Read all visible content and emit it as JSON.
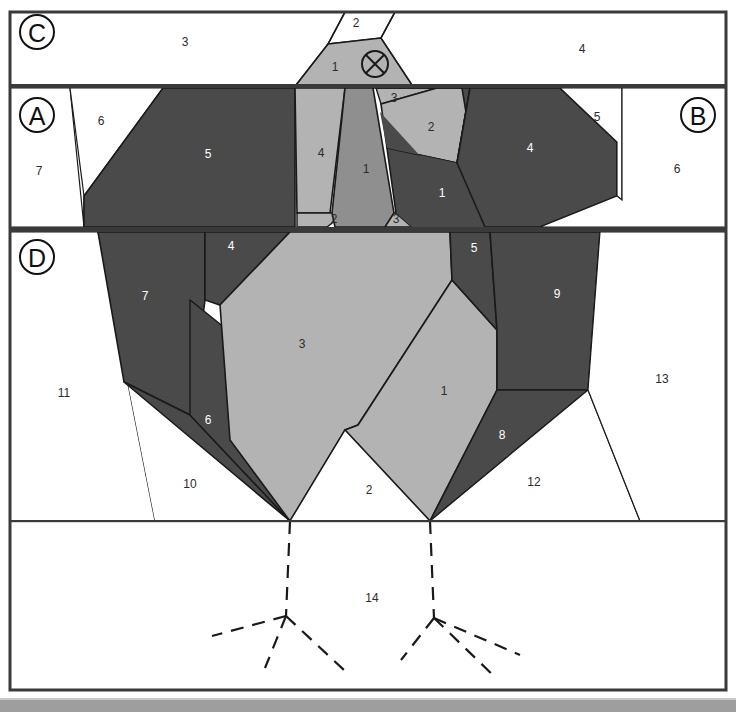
{
  "figure": {
    "kind": "technical-line-diagram",
    "width": 736,
    "height": 712,
    "panels": [
      {
        "id": "C",
        "letter": "C",
        "cx": 37,
        "cy": 32
      },
      {
        "id": "A",
        "letter": "A",
        "cx": 37,
        "cy": 115
      },
      {
        "id": "B",
        "letter": "B",
        "cx": 698,
        "cy": 115
      },
      {
        "id": "D",
        "letter": "D",
        "cx": 37,
        "cy": 257
      }
    ],
    "colors": {
      "white": "#ffffff",
      "light_gray": "#b3b3b3",
      "mid_gray": "#8f8f8f",
      "dark_gray": "#4a4a4a",
      "stroke": "#1a1a1a",
      "frame": "#3a3a3a",
      "page_bottom_band": "#9e9e9e",
      "label_dark": "#2b2b2b",
      "label_light": "#ffffff"
    },
    "marker": {
      "name": "circled-cross-marker",
      "cx": 375,
      "cy": 64,
      "r": 13
    },
    "regions_panel_c": [
      {
        "label": "3",
        "x": 185,
        "y": 43
      },
      {
        "label": "4",
        "x": 582,
        "y": 50
      },
      {
        "label": "2",
        "x": 356,
        "y": 24
      },
      {
        "label": "1",
        "x": 335,
        "y": 68
      }
    ],
    "regions_panel_a": [
      {
        "label": "6",
        "x": 101,
        "y": 122
      },
      {
        "label": "7",
        "x": 39,
        "y": 172
      },
      {
        "label": "5",
        "x": 208,
        "y": 155
      },
      {
        "label": "4",
        "x": 321,
        "y": 154
      },
      {
        "label": "1",
        "x": 366,
        "y": 170
      },
      {
        "label": "2",
        "x": 334,
        "y": 220
      },
      {
        "label": "3",
        "x": 396,
        "y": 220
      },
      {
        "label": "3",
        "x": 394,
        "y": 99
      },
      {
        "label": "2",
        "x": 431,
        "y": 128
      },
      {
        "label": "1",
        "x": 442,
        "y": 194
      },
      {
        "label": "4",
        "x": 530,
        "y": 149
      },
      {
        "label": "5",
        "x": 597,
        "y": 118
      },
      {
        "label": "6",
        "x": 677,
        "y": 170
      }
    ],
    "regions_panel_d": [
      {
        "label": "7",
        "x": 145,
        "y": 297
      },
      {
        "label": "4",
        "x": 231,
        "y": 247
      },
      {
        "label": "3",
        "x": 302,
        "y": 345
      },
      {
        "label": "6",
        "x": 208,
        "y": 421
      },
      {
        "label": "11",
        "x": 64,
        "y": 394
      },
      {
        "label": "10",
        "x": 190,
        "y": 485
      },
      {
        "label": "2",
        "x": 369,
        "y": 491
      },
      {
        "label": "1",
        "x": 444,
        "y": 392
      },
      {
        "label": "5",
        "x": 474,
        "y": 249
      },
      {
        "label": "9",
        "x": 557,
        "y": 295
      },
      {
        "label": "8",
        "x": 502,
        "y": 436
      },
      {
        "label": "12",
        "x": 534,
        "y": 483
      },
      {
        "label": "13",
        "x": 662,
        "y": 380
      }
    ],
    "regions_panel_bottom": [
      {
        "label": "14",
        "x": 372,
        "y": 599
      }
    ]
  }
}
